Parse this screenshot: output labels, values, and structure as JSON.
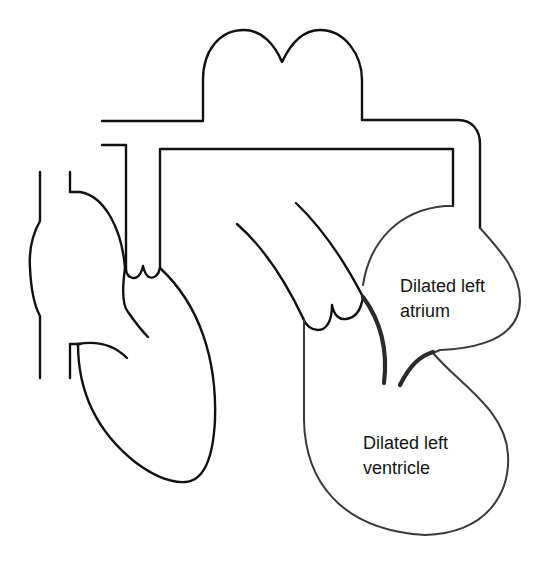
{
  "diagram": {
    "labels": {
      "left_atrium": {
        "line1": "Dilated left",
        "line2": "atrium"
      },
      "left_ventricle": {
        "line1": "Dilated left",
        "line2": "ventricle"
      }
    },
    "colors": {
      "background": "#ffffff",
      "outline": "#111111",
      "chamber_outline": "#3a3a3a",
      "leaflet": "#2a2a2a",
      "text": "#141414"
    }
  }
}
